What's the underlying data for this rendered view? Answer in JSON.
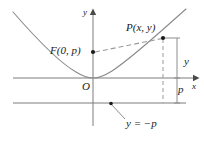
{
  "figure": {
    "kind": "parabola-focus-directrix-diagram",
    "axes": {
      "x_axis_label": "x",
      "y_axis_label": "y",
      "origin_label": "O"
    },
    "labels": {
      "focus": "F(0, p)",
      "point": "P(x, y)",
      "vertical_distance": "y",
      "focal_gap": "p",
      "directrix": "y = −p"
    },
    "colors": {
      "curve": "#8a8a8a",
      "axis": "#7d7d7d",
      "dashed": "#9a9a9a",
      "text": "#1a1a1a",
      "point": "#1a1a1a",
      "background": "#ffffff"
    },
    "geometry": {
      "x_axis_y": 78,
      "y_axis_x": 93,
      "directrix_y": 103,
      "focus_point": [
        93,
        52
      ],
      "curve_point_P": [
        163,
        38
      ],
      "drop_line_x": 177,
      "vertex": [
        93,
        78
      ]
    }
  }
}
